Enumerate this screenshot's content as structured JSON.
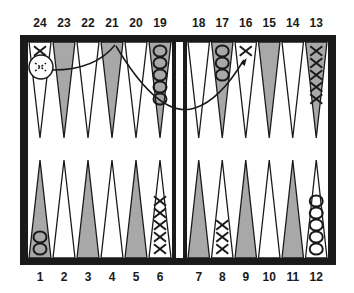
{
  "board": {
    "top_labels": [
      "24",
      "23",
      "22",
      "21",
      "20",
      "19",
      "18",
      "17",
      "16",
      "15",
      "14",
      "13"
    ],
    "bottom_labels": [
      "1",
      "2",
      "3",
      "4",
      "5",
      "6",
      "7",
      "8",
      "9",
      "10",
      "11",
      "12"
    ],
    "colors": {
      "frame": "#1a1a1a",
      "shaded_point": "#a8a8a8",
      "light_point": "#ffffff",
      "ink": "#1a1a1a"
    },
    "checkers": [
      {
        "point": "24",
        "type": "X",
        "count": 1
      },
      {
        "point": "24",
        "type": "X-hit-circled",
        "count": 1
      },
      {
        "point": "19",
        "type": "O",
        "count": 5
      },
      {
        "point": "17",
        "type": "O",
        "count": 3
      },
      {
        "point": "16",
        "type": "X",
        "count": 1
      },
      {
        "point": "13",
        "type": "X",
        "count": 5
      },
      {
        "point": "1",
        "type": "O",
        "count": 2
      },
      {
        "point": "6",
        "type": "X",
        "count": 5
      },
      {
        "point": "8",
        "type": "X",
        "count": 3
      },
      {
        "point": "12",
        "type": "O",
        "count": 5
      }
    ],
    "arrows": [
      {
        "from": "24",
        "to": "21"
      },
      {
        "from": "21",
        "to": "16"
      }
    ]
  }
}
